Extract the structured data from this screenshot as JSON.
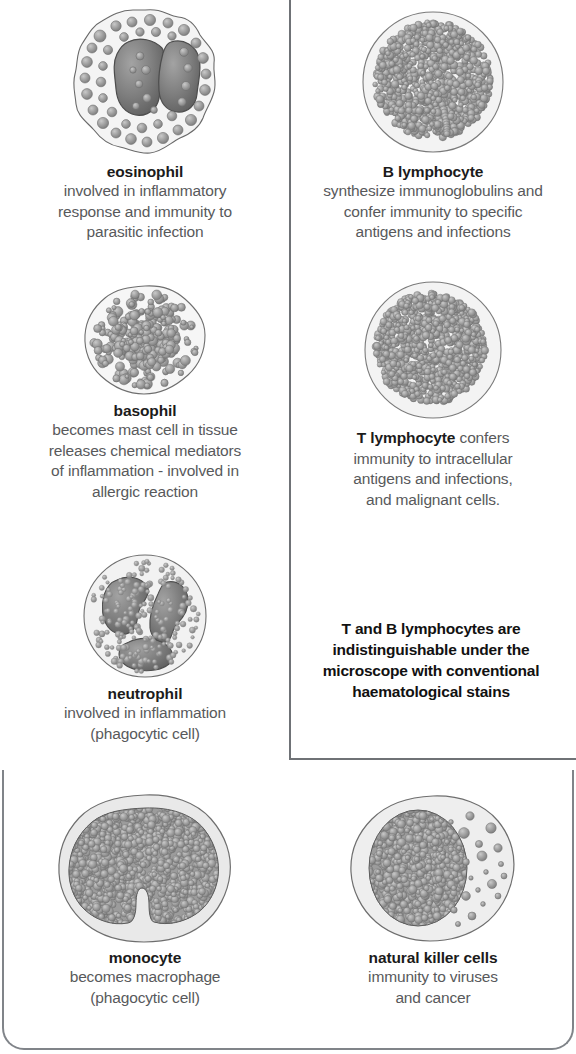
{
  "figure": {
    "background_color": "#ffffff",
    "text_color": "#58595b",
    "bold_text_color": "#1b1b1b",
    "border_color": "#6f7276",
    "cytoplasm_color": "#ececec",
    "granule_color": "#8e8e8e",
    "nucleus_color": "#7b7b7b"
  },
  "lymphocyte_box": {
    "name": "lymphocyte-box",
    "note": {
      "lines": [
        "T and B lymphocytes are",
        "indistinguishable under the",
        "microscope with conventional",
        "haematological stains"
      ]
    }
  },
  "cells": [
    {
      "id": "eosinophil",
      "name": "eosinophil",
      "icon": "eosinophil-cell-icon",
      "description_lines": [
        "involved in inflammatory",
        "response and immunity to",
        "parasitic infection"
      ],
      "name_inline": false
    },
    {
      "id": "b-lymphocyte",
      "name": "B lymphocyte",
      "icon": "b-lymphocyte-cell-icon",
      "description_lines": [
        "synthesize immunoglobulins and",
        "confer immunity to specific",
        "antigens and infections"
      ],
      "name_inline": false
    },
    {
      "id": "basophil",
      "name": "basophil",
      "icon": "basophil-cell-icon",
      "description_lines": [
        "becomes mast cell in tissue",
        "releases chemical mediators",
        "of inflammation - involved in",
        "allergic reaction"
      ],
      "name_inline": false
    },
    {
      "id": "t-lymphocyte",
      "name": "T lymphocyte",
      "icon": "t-lymphocyte-cell-icon",
      "inline_suffix": " confers",
      "description_lines": [
        "immunity to intracellular",
        "antigens and infections,",
        "and malignant cells."
      ],
      "name_inline": true
    },
    {
      "id": "neutrophil",
      "name": "neutrophil",
      "icon": "neutrophil-cell-icon",
      "description_lines": [
        "involved in inflammation",
        "(phagocytic cell)"
      ],
      "name_inline": false
    },
    {
      "id": "monocyte",
      "name": "monocyte",
      "icon": "monocyte-cell-icon",
      "description_lines": [
        "becomes macrophage",
        "(phagocytic cell)"
      ],
      "name_inline": false
    },
    {
      "id": "natural-killer-cells",
      "name": "natural killer cells",
      "icon": "natural-killer-cell-icon",
      "description_lines": [
        "immunity to viruses",
        "and cancer"
      ],
      "name_inline": false
    }
  ]
}
